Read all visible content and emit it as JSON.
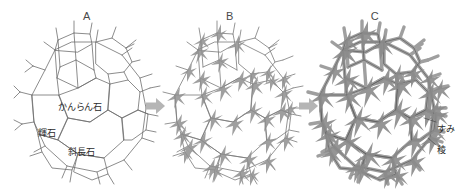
{
  "figure": {
    "background_color": "#ffffff",
    "line_color": "#6b6b6b",
    "fill_color": "#ffffff",
    "arrow_color": "#b3b3b3",
    "text_color": "#2b2b2b"
  },
  "panels": [
    {
      "letter": "A",
      "name": "panel-a",
      "stage_description": "polyhedral grains with straight thin boundaries"
    },
    {
      "letter": "B",
      "name": "panel-b",
      "stage_description": "grain boundaries thickening at triple junctions"
    },
    {
      "letter": "C",
      "name": "panel-c",
      "stage_description": "thick melt-filled edges and corners"
    }
  ],
  "arrows": [
    {
      "name": "arrow-a-to-b",
      "glyph": "right-arrow"
    },
    {
      "name": "arrow-b-to-c",
      "glyph": "right-arrow"
    }
  ],
  "mineral_labels": [
    {
      "name": "olivine",
      "text": "かんらん石"
    },
    {
      "name": "pyroxene",
      "text": "輝石"
    },
    {
      "name": "plagioclase",
      "text": "斜長石"
    }
  ],
  "part_labels": [
    {
      "name": "corner",
      "text": "すみ"
    },
    {
      "name": "edge",
      "text": "稜"
    }
  ]
}
